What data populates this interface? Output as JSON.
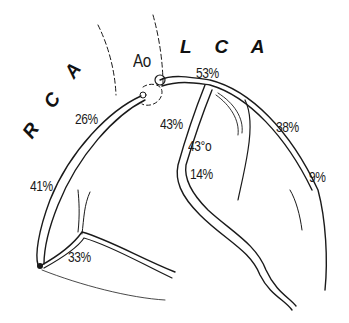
{
  "diagram": {
    "labels": {
      "aorta": "Ao",
      "lca": "L C A",
      "rca": "R C A"
    },
    "percentages": {
      "lca_main": "53%",
      "rca_proximal": "26%",
      "lad_proximal": "43%",
      "lad_mid": "43°o",
      "lad_distal": "14%",
      "circumflex": "38%",
      "circumflex_distal": "9%",
      "rca_mid": "41%",
      "rca_distal": "33%"
    },
    "colors": {
      "line": "#1a1a1a",
      "background": "#ffffff"
    }
  }
}
